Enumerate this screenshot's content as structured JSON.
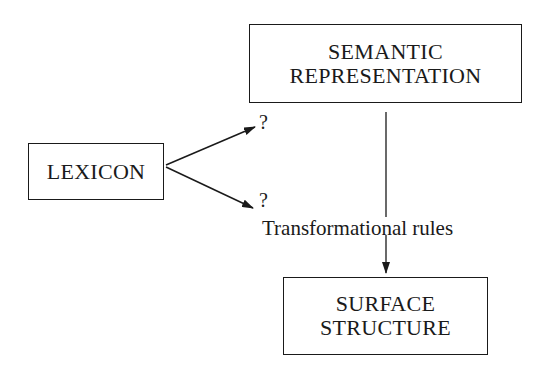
{
  "diagram": {
    "nodes": {
      "semantic": {
        "line1": "SEMANTIC",
        "line2": "REPRESENTATION"
      },
      "lexicon": {
        "label": "LEXICON"
      },
      "surface": {
        "line1": "SURFACE",
        "line2": "STRUCTURE"
      }
    },
    "labels": {
      "unknown_upper": "?",
      "unknown_lower": "?",
      "transformational_rules": "Transformational rules"
    },
    "edges": [
      {
        "from": "lexicon",
        "to": "unknown_upper",
        "type": "arrow"
      },
      {
        "from": "lexicon",
        "to": "unknown_lower",
        "type": "arrow"
      },
      {
        "from": "semantic",
        "to": "surface",
        "type": "arrow",
        "label": "Transformational rules"
      }
    ],
    "colors": {
      "ink": "#1a1a1a",
      "background": "#ffffff"
    }
  }
}
